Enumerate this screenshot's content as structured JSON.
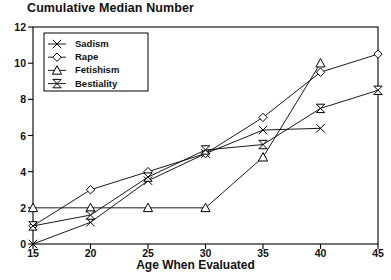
{
  "chart_data": {
    "type": "line",
    "title": "Cumulative Median Number",
    "xlabel": "Age When Evaluated",
    "ylabel": "",
    "xlim": [
      15,
      45
    ],
    "ylim": [
      0,
      12
    ],
    "xticks": [
      15,
      20,
      25,
      30,
      35,
      40,
      45
    ],
    "yticks": [
      0,
      2,
      4,
      6,
      8,
      10,
      12
    ],
    "grid": false,
    "legend_position": "top-left",
    "series": [
      {
        "name": "Sadism",
        "marker": "x-cross",
        "x": [
          15,
          20,
          25,
          30,
          35,
          40
        ],
        "values": [
          0,
          1.2,
          3.5,
          5.0,
          6.3,
          6.4
        ]
      },
      {
        "name": "Rape",
        "marker": "diamond",
        "x": [
          15,
          20,
          25,
          30,
          35,
          40,
          45
        ],
        "values": [
          1.0,
          3.0,
          4.0,
          5.0,
          7.0,
          9.5,
          10.5
        ]
      },
      {
        "name": "Fetishism",
        "marker": "triangle-up",
        "x": [
          15,
          20,
          25,
          30,
          35,
          40
        ],
        "values": [
          2.0,
          2.0,
          2.0,
          2.0,
          4.8,
          10.0
        ]
      },
      {
        "name": "Bestiality",
        "marker": "bowtie",
        "x": [
          15,
          20,
          25,
          30,
          35,
          40,
          45
        ],
        "values": [
          1.0,
          1.6,
          3.7,
          5.2,
          5.5,
          7.5,
          8.5
        ]
      }
    ]
  },
  "axis": {
    "x_tick_labels": [
      "15",
      "20",
      "25",
      "30",
      "35",
      "40",
      "45"
    ],
    "y_tick_labels": [
      "0",
      "2",
      "4",
      "6",
      "8",
      "10",
      "12"
    ],
    "x_title": "Age When Evaluated"
  },
  "title": "Cumulative Median Number",
  "legend": {
    "entries": [
      {
        "label": "Sadism",
        "marker": "x-cross"
      },
      {
        "label": "Rape",
        "marker": "diamond"
      },
      {
        "label": "Fetishism",
        "marker": "triangle-up"
      },
      {
        "label": "Bestiality",
        "marker": "bowtie"
      }
    ]
  },
  "colors": {
    "line": "#000000",
    "frame": "#000000",
    "text": "#111111",
    "background": "#ffffff"
  }
}
